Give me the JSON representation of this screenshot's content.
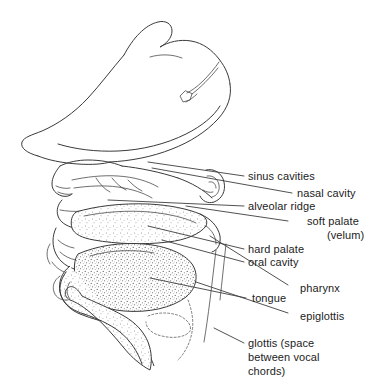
{
  "figure": {
    "background_color": "#ffffff",
    "line_color": "#3a3a3a",
    "text_color": "#1c1c1c",
    "width": 392,
    "height": 387
  },
  "labels": [
    {
      "id": "sinus-cavities",
      "text": "sinus cavities",
      "x": 248,
      "y": 170
    },
    {
      "id": "nasal-cavity",
      "text": "nasal cavity",
      "x": 297,
      "y": 187
    },
    {
      "id": "alveolar-ridge",
      "text": "alveolar ridge",
      "x": 248,
      "y": 200
    },
    {
      "id": "soft-palate",
      "text": "soft palate",
      "x": 307,
      "y": 215
    },
    {
      "id": "velum",
      "text": "(velum)",
      "x": 327,
      "y": 229
    },
    {
      "id": "hard-palate",
      "text": "hard palate",
      "x": 248,
      "y": 243
    },
    {
      "id": "oral-cavity",
      "text": "oral cavity",
      "x": 248,
      "y": 256
    },
    {
      "id": "pharynx",
      "text": "pharynx",
      "x": 300,
      "y": 282
    },
    {
      "id": "tongue",
      "text": "tongue",
      "x": 252,
      "y": 292
    },
    {
      "id": "epiglottis",
      "text": "epiglottis",
      "x": 300,
      "y": 310
    },
    {
      "id": "glottis",
      "text": "glottis (space",
      "x": 248,
      "y": 337
    },
    {
      "id": "glottis-line2",
      "text": "between vocal",
      "x": 248,
      "y": 351
    },
    {
      "id": "glottis-line3",
      "text": "chords)",
      "x": 248,
      "y": 365
    }
  ],
  "leader_lines": [
    {
      "id": "leader-sinus-cavities",
      "from_x": 148,
      "from_y": 162,
      "to_x": 244,
      "to_y": 176
    },
    {
      "id": "leader-nasal-cavity",
      "from_x": 152,
      "from_y": 168,
      "to_x": 292,
      "to_y": 193
    },
    {
      "id": "leader-alveolar-ridge",
      "from_x": 108,
      "from_y": 200,
      "to_x": 244,
      "to_y": 206
    },
    {
      "id": "leader-soft-palate",
      "from_x": 186,
      "from_y": 206,
      "to_x": 288,
      "to_y": 221
    },
    {
      "id": "leader-hard-palate",
      "from_x": 148,
      "from_y": 226,
      "to_x": 244,
      "to_y": 249
    },
    {
      "id": "leader-oral-cavity",
      "from_x": 162,
      "from_y": 240,
      "to_x": 244,
      "to_y": 262
    },
    {
      "id": "leader-pharynx",
      "from_x": 210,
      "from_y": 236,
      "to_x": 288,
      "to_y": 285
    },
    {
      "id": "leader-tongue",
      "from_x": 150,
      "from_y": 278,
      "to_x": 246,
      "to_y": 298
    },
    {
      "id": "leader-epiglottis",
      "from_x": 196,
      "from_y": 282,
      "to_x": 288,
      "to_y": 313
    },
    {
      "id": "leader-glottis",
      "from_x": 214,
      "from_y": 328,
      "to_x": 244,
      "to_y": 343
    }
  ],
  "regions": [
    {
      "id": "hat",
      "name": "hat-outline"
    },
    {
      "id": "face",
      "name": "face-profile"
    },
    {
      "id": "ear",
      "name": "ear"
    },
    {
      "id": "palate",
      "name": "palate-shading"
    },
    {
      "id": "tongue-body",
      "name": "tongue-shading"
    },
    {
      "id": "larynx",
      "name": "larynx-shading"
    },
    {
      "id": "epiglottis-flap",
      "name": "epiglottis-flap"
    }
  ]
}
